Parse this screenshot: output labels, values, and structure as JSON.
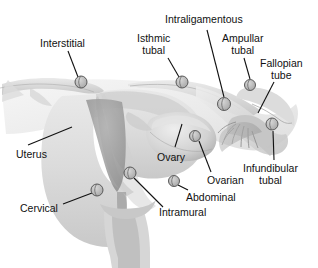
{
  "diagram": {
    "style": "grayscale medical illustration",
    "background_color": "#ffffff",
    "line_color": "#111111",
    "marker_color": "#4a4a4a",
    "marker_count": 9,
    "labels": [
      {
        "id": "interstitial",
        "text": "Interstitial",
        "x": 40,
        "y": 38,
        "align": "left",
        "lines": [
          "Interstitial"
        ]
      },
      {
        "id": "isthmic-tubal",
        "text": "Isthmic tubal",
        "x": 137,
        "y": 33,
        "align": "center",
        "lines": [
          "Isthmic",
          "tubal"
        ]
      },
      {
        "id": "intraligamentous",
        "text": "Intraligamentous",
        "x": 165,
        "y": 14,
        "align": "left",
        "lines": [
          "Intraligamentous"
        ]
      },
      {
        "id": "ampullar-tubal",
        "text": "Ampullar tubal",
        "x": 222,
        "y": 33,
        "align": "center",
        "lines": [
          "Ampullar",
          "tubal"
        ]
      },
      {
        "id": "fallopian-tube",
        "text": "Fallopian tube",
        "x": 260,
        "y": 58,
        "align": "center",
        "lines": [
          "Fallopian",
          "tube"
        ]
      },
      {
        "id": "infundibular-tubal",
        "text": "Infundibular tubal",
        "x": 243,
        "y": 163,
        "align": "left",
        "lines": [
          "Infundibular",
          "tubal"
        ]
      },
      {
        "id": "ovarian",
        "text": "Ovarian",
        "x": 207,
        "y": 175,
        "align": "left",
        "lines": [
          "Ovarian"
        ]
      },
      {
        "id": "ovary",
        "text": "Ovary",
        "x": 157,
        "y": 152,
        "align": "left",
        "lines": [
          "Ovary"
        ]
      },
      {
        "id": "abdominal",
        "text": "Abdominal",
        "x": 186,
        "y": 192,
        "align": "left",
        "lines": [
          "Abdominal"
        ]
      },
      {
        "id": "intramural",
        "text": "Intramural",
        "x": 159,
        "y": 207,
        "align": "left",
        "lines": [
          "Intramural"
        ]
      },
      {
        "id": "uterus",
        "text": "Uterus",
        "x": 16,
        "y": 149,
        "align": "left",
        "lines": [
          "Uterus"
        ]
      },
      {
        "id": "cervical",
        "text": "Cervical",
        "x": 20,
        "y": 203,
        "align": "left",
        "lines": [
          "Cervical"
        ]
      }
    ],
    "markers": [
      {
        "id": "marker-interstitial",
        "cx": 81,
        "cy": 82,
        "r": 6.0
      },
      {
        "id": "marker-isthmic-tubal",
        "cx": 182,
        "cy": 82,
        "r": 6.0
      },
      {
        "id": "marker-intraligamentous",
        "cx": 224,
        "cy": 104,
        "r": 6.5
      },
      {
        "id": "marker-ampullar-tubal",
        "cx": 250,
        "cy": 85,
        "r": 5.5
      },
      {
        "id": "marker-infundibular-tubal",
        "cx": 272,
        "cy": 124,
        "r": 6.0
      },
      {
        "id": "marker-ovarian",
        "cx": 195,
        "cy": 136,
        "r": 5.5
      },
      {
        "id": "marker-abdominal",
        "cx": 174,
        "cy": 181,
        "r": 5.5
      },
      {
        "id": "marker-intramural",
        "cx": 130,
        "cy": 173,
        "r": 6.0
      },
      {
        "id": "marker-cervical",
        "cx": 97,
        "cy": 190,
        "r": 6.0
      }
    ],
    "leaders": [
      {
        "id": "leader-interstitial",
        "x1": 68,
        "y1": 51,
        "x2": 78,
        "y2": 77
      },
      {
        "id": "leader-isthmic-tubal",
        "x1": 168,
        "y1": 58,
        "x2": 179,
        "y2": 77
      },
      {
        "id": "leader-intraligamentous",
        "x1": 207,
        "y1": 30,
        "x2": 224,
        "y2": 97
      },
      {
        "id": "leader-ampullar-tubal",
        "x1": 244,
        "y1": 58,
        "x2": 250,
        "y2": 79
      },
      {
        "id": "leader-fallopian-tube",
        "x1": 274,
        "y1": 82,
        "x2": 258,
        "y2": 113
      },
      {
        "id": "leader-infundibular-tubal",
        "x1": 274,
        "y1": 160,
        "x2": 273,
        "y2": 131
      },
      {
        "id": "leader-ovarian",
        "x1": 211,
        "y1": 172,
        "x2": 199,
        "y2": 141
      },
      {
        "id": "leader-ovary",
        "x1": 175,
        "y1": 147,
        "x2": 182,
        "y2": 124
      },
      {
        "id": "leader-abdominal",
        "x1": 188,
        "y1": 190,
        "x2": 178,
        "y2": 185
      },
      {
        "id": "leader-intramural",
        "x1": 163,
        "y1": 207,
        "x2": 134,
        "y2": 178
      },
      {
        "id": "leader-uterus",
        "x1": 28,
        "y1": 145,
        "x2": 72,
        "y2": 127
      },
      {
        "id": "leader-cervical",
        "x1": 63,
        "y1": 204,
        "x2": 92,
        "y2": 193
      }
    ]
  }
}
